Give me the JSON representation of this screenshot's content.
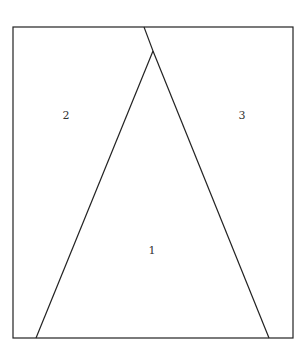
{
  "diagram": {
    "regions": [
      {
        "id": "region-1",
        "label": "1"
      },
      {
        "id": "region-2",
        "label": "2"
      },
      {
        "id": "region-3",
        "label": "3"
      }
    ],
    "colors": {
      "stroke": "#222222",
      "background": "#ffffff",
      "label": "#333333"
    }
  }
}
